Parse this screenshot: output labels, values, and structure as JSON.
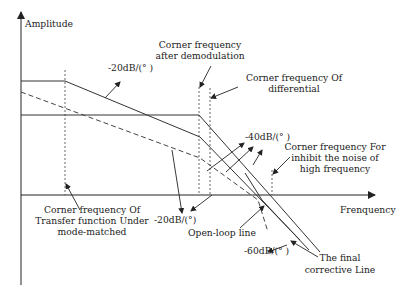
{
  "diagram": {
    "axes": {
      "y_label": "Amplitude",
      "x_label": "Frenquency"
    },
    "slope_labels": {
      "top": "-20dB/(° )",
      "middle": "-40dB/(° )",
      "bottom_left": "-20dB/(°)",
      "bottom_right": "-60dB/(° )"
    },
    "annotations": {
      "demod_line1": "Corner frequency",
      "demod_line2": "after demodulation",
      "diff_line1": "Corner frequency Of",
      "diff_line2": "differential",
      "noise_line1": "Corner frequency For",
      "noise_line2": "inhibit the noise of",
      "noise_line3": "high frequency",
      "mm_line1": "Corner frequency Of",
      "mm_line2": "Transfer function Under",
      "mm_line3": "mode-matched",
      "open_loop": "Open-loop line",
      "final_line1": "The final",
      "final_line2": "corrective Line"
    },
    "colors": {
      "line": "#333333",
      "background": "#ffffff"
    }
  }
}
